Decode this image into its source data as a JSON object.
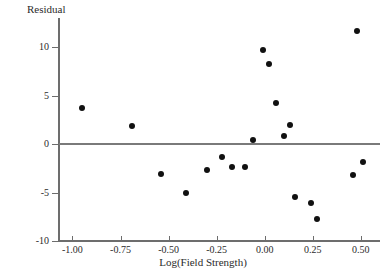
{
  "chart_data": {
    "type": "scatter",
    "title": "",
    "xlabel": "Log(Field Strength)",
    "ylabel": "Residual",
    "xlim": [
      -1.07,
      0.6
    ],
    "ylim": [
      -10,
      13
    ],
    "grid": false,
    "legend": null,
    "zero_reference_line": 0,
    "xticks": [
      -1.0,
      -0.75,
      -0.5,
      -0.25,
      0.0,
      0.25,
      0.5
    ],
    "xticklabels": [
      "-1.00",
      "-0.75",
      "-0.50",
      "-0.25",
      "0.00",
      "0.25",
      "0.50"
    ],
    "yticks": [
      -10,
      -5,
      0,
      5,
      10
    ],
    "yticklabels": [
      "-10",
      "-5",
      "0",
      "5",
      "10"
    ],
    "points": [
      {
        "x": -0.95,
        "y": 3.7
      },
      {
        "x": -0.69,
        "y": 1.9
      },
      {
        "x": -0.54,
        "y": -3.1
      },
      {
        "x": -0.41,
        "y": -5.1
      },
      {
        "x": -0.3,
        "y": -2.7
      },
      {
        "x": -0.22,
        "y": -1.3
      },
      {
        "x": -0.17,
        "y": -2.4
      },
      {
        "x": -0.1,
        "y": -2.4
      },
      {
        "x": -0.06,
        "y": 0.4
      },
      {
        "x": -0.01,
        "y": 9.7
      },
      {
        "x": 0.02,
        "y": 8.3
      },
      {
        "x": 0.06,
        "y": 4.2
      },
      {
        "x": 0.1,
        "y": 0.8
      },
      {
        "x": 0.13,
        "y": 2.0
      },
      {
        "x": 0.16,
        "y": -5.5
      },
      {
        "x": 0.24,
        "y": -6.1
      },
      {
        "x": 0.27,
        "y": -7.7
      },
      {
        "x": 0.46,
        "y": -3.2
      },
      {
        "x": 0.48,
        "y": 11.7
      },
      {
        "x": 0.51,
        "y": -1.9
      }
    ]
  },
  "colors": {
    "point": "#111111",
    "axis": "#6d6d6d",
    "zero_line": "#7a7a7a",
    "text": "#2b2b2b",
    "background": "#ffffff"
  }
}
